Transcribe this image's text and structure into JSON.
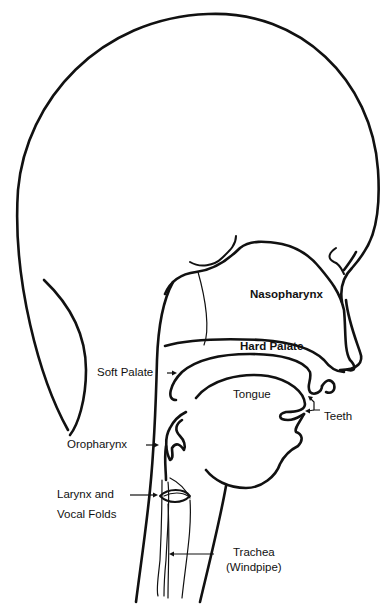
{
  "diagram": {
    "line_color": "#111111",
    "background": "#ffffff",
    "labels": {
      "nasopharynx": "Nasopharynx",
      "hard_palate": "Hard Palate",
      "soft_palate": "Soft Palate",
      "tongue": "Tongue",
      "teeth": "Teeth",
      "oropharynx": "Oropharynx",
      "larynx_line1": "Larynx and",
      "larynx_line2": "Vocal Folds",
      "trachea_line1": "Trachea",
      "trachea_line2": "(Windpipe)"
    }
  }
}
